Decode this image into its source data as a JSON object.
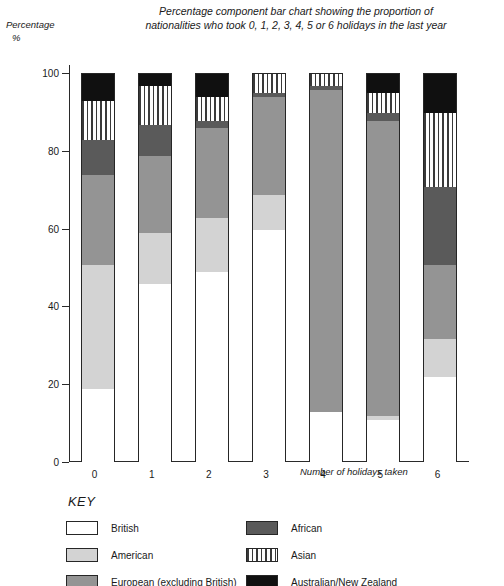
{
  "chart_data": {
    "type": "bar",
    "subtype": "percentage-component-stacked-bar",
    "title": "Percentage component bar chart showing the proportion of nationalities who took 0, 1, 2, 3, 4, 5 or 6 holidays in the last year",
    "title_lines": [
      "Percentage component bar chart showing the proportion of",
      "nationalities who took 0, 1, 2, 3, 4, 5 or 6 holidays in the last year"
    ],
    "ylabel": "Percentage",
    "ylabel_unit": "%",
    "xlabel": "Number of holidays taken",
    "ylim": [
      0,
      100
    ],
    "yticks": [
      0,
      20,
      40,
      60,
      80,
      100
    ],
    "ytick_labels": [
      "0",
      "20",
      "40",
      "60",
      "80",
      "100"
    ],
    "grid": false,
    "legend_position": "below-plot",
    "legend_title": "KEY",
    "categories": [
      "0",
      "1",
      "2",
      "3",
      "4",
      "5",
      "6"
    ],
    "series": [
      {
        "name": "British",
        "color": "#ffffff",
        "pattern": "solid",
        "values": [
          19,
          46,
          49,
          60,
          13,
          11,
          22
        ]
      },
      {
        "name": "American",
        "color": "#d3d3d3",
        "pattern": "solid",
        "values": [
          32,
          13,
          14,
          9,
          0,
          1,
          10
        ]
      },
      {
        "name": "European (excluding British)",
        "color": "#949494",
        "pattern": "solid",
        "values": [
          23,
          20,
          23,
          25,
          83,
          76,
          19
        ]
      },
      {
        "name": "African",
        "color": "#5a5a5a",
        "pattern": "solid",
        "values": [
          9,
          8,
          2,
          1,
          1,
          2,
          20
        ]
      },
      {
        "name": "Asian",
        "color": "#ffffff",
        "pattern": "vertical-stripes",
        "values": [
          10,
          10,
          6,
          5,
          3,
          5,
          19
        ]
      },
      {
        "name": "Australian/New Zealand",
        "color": "#101010",
        "pattern": "solid",
        "values": [
          7,
          3,
          6,
          0,
          0,
          5,
          10
        ]
      }
    ]
  },
  "legend": {
    "title": "KEY",
    "left_items": [
      {
        "label": "British",
        "swatch": "british-swatch"
      },
      {
        "label": "American",
        "swatch": "american-swatch"
      },
      {
        "label": "European (excluding British)",
        "swatch": "european-swatch"
      }
    ],
    "right_items": [
      {
        "label": "African",
        "swatch": "african-swatch"
      },
      {
        "label": "Asian",
        "swatch": "asian-swatch"
      },
      {
        "label": "Australian/New Zealand",
        "swatch": "ausnz-swatch"
      }
    ]
  },
  "colors": {
    "british": "#ffffff",
    "american": "#d3d3d3",
    "european": "#949494",
    "african": "#5a5a5a",
    "asian_stripe": "#3a3a3a",
    "ausnz": "#101010",
    "axis": "#2a2a2a",
    "background": "#ffffff"
  }
}
